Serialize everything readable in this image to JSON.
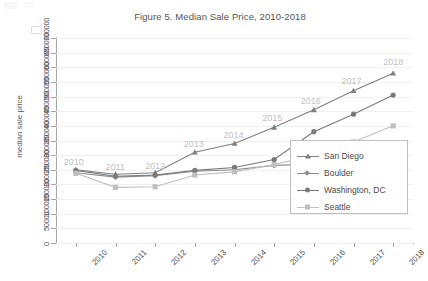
{
  "chart_data": {
    "type": "line",
    "title": "Figure 5. Median Sale Price, 2010-2018",
    "xlabel": "",
    "ylabel": "median sale price",
    "categories": [
      "2010",
      "2011",
      "2012",
      "2013",
      "2014",
      "2015",
      "2016",
      "2017",
      "2018"
    ],
    "x_tick_labels": [
      "2010",
      "2011",
      "2012",
      "2013",
      "2014",
      "2015",
      "2016",
      "2017",
      "2018"
    ],
    "y_tick_labels": [
      "0",
      "50000",
      "100000",
      "150000",
      "200000",
      "250000",
      "300000",
      "350000",
      "400000",
      "450000",
      "500000",
      "550000",
      "600000",
      "650000",
      "700000"
    ],
    "ylim": [
      0,
      700000
    ],
    "y_tick_step": 50000,
    "grid": true,
    "legend_position": "bottom-right",
    "data_labels": [
      "2010",
      "2011",
      "2012",
      "2013",
      "2014",
      "2015",
      "2016",
      "2017",
      "2018"
    ],
    "series": [
      {
        "name": "San Diego",
        "marker": "triangle",
        "color": "#7f7f7f",
        "values": [
          250000,
          235000,
          240000,
          310000,
          340000,
          395000,
          455000,
          520000,
          580000
        ]
      },
      {
        "name": "Boulder",
        "marker": "diamond",
        "color": "#8c8c8c",
        "values": [
          240000,
          225000,
          230000,
          245000,
          250000,
          265000,
          270000,
          272000,
          285000
        ]
      },
      {
        "name": "Washington, DC",
        "marker": "circle",
        "color": "#7a7a7a",
        "values": [
          248000,
          228000,
          232000,
          248000,
          258000,
          285000,
          380000,
          440000,
          505000
        ]
      },
      {
        "name": "Seattle",
        "marker": "square",
        "color": "#bfbfbf",
        "values": [
          238000,
          190000,
          192000,
          232000,
          243000,
          268000,
          300000,
          345000,
          400000
        ]
      }
    ]
  },
  "legend": {
    "items": [
      {
        "label": "San Diego"
      },
      {
        "label": "Boulder"
      },
      {
        "label": "Washington, DC"
      },
      {
        "label": "Seattle"
      }
    ]
  }
}
